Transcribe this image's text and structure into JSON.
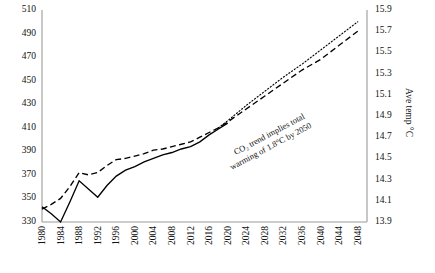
{
  "chart_data": {
    "type": "line",
    "title": "",
    "xlabel": "",
    "ylabel": "",
    "y2label": "Ave temp °C",
    "grid": false,
    "legend_position": "none",
    "xlim": [
      1980,
      2050
    ],
    "ylim": [
      330,
      510
    ],
    "y2lim": [
      13.9,
      15.9
    ],
    "x_ticks": [
      1980,
      1984,
      1988,
      1992,
      1996,
      2000,
      2004,
      2008,
      2012,
      2016,
      2020,
      2024,
      2028,
      2032,
      2036,
      2040,
      2044,
      2048
    ],
    "y_ticks": [
      330,
      350,
      370,
      390,
      410,
      430,
      450,
      470,
      490,
      510
    ],
    "y2_ticks": [
      13.9,
      14.1,
      14.3,
      14.5,
      14.7,
      14.9,
      15.1,
      15.3,
      15.5,
      15.7,
      15.9
    ],
    "annotations": [
      {
        "text_line1": "CO₂ trend implies total",
        "text_line2": "warming of 1.8°C by 2050",
        "rotation_deg": -28
      }
    ],
    "series": [
      {
        "name": "temperature-observed",
        "style": "solid",
        "color": "#000000",
        "x": [
          1980,
          1982,
          1984,
          1986,
          1988,
          1990,
          1992,
          1994,
          1996,
          1998,
          2000,
          2002,
          2004,
          2006,
          2008,
          2010,
          2012,
          2014,
          2016,
          2018,
          2020
        ],
        "values": [
          343,
          337,
          330,
          347,
          365,
          358,
          351,
          361,
          369,
          374,
          377,
          381,
          384,
          387,
          389,
          392,
          394,
          398,
          404,
          409,
          414
        ]
      },
      {
        "name": "co2-observed",
        "style": "dashed",
        "color": "#000000",
        "x": [
          1980,
          1982,
          1984,
          1986,
          1988,
          1990,
          1992,
          1994,
          1996,
          1998,
          2000,
          2002,
          2004,
          2006,
          2008,
          2010,
          2012,
          2014,
          2016,
          2018,
          2020,
          2024,
          2028,
          2032,
          2036,
          2040,
          2044,
          2048
        ],
        "values": [
          341,
          345,
          350,
          360,
          372,
          370,
          372,
          378,
          383,
          384,
          386,
          388,
          391,
          392,
          394,
          396,
          398,
          402,
          406,
          410,
          415,
          426,
          437,
          448,
          459,
          468,
          480,
          492
        ]
      },
      {
        "name": "co2-projection",
        "style": "dotted",
        "color": "#000000",
        "x": [
          2018,
          2020,
          2024,
          2028,
          2032,
          2036,
          2040,
          2044,
          2048
        ],
        "values": [
          410,
          416,
          429,
          441,
          453,
          464,
          476,
          488,
          500
        ]
      }
    ]
  }
}
